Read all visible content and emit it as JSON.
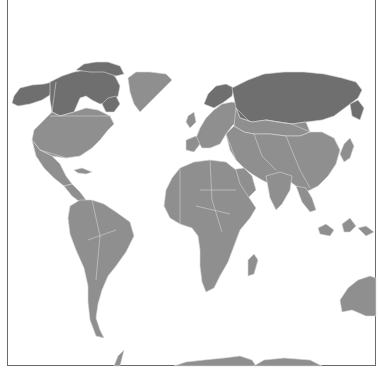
{
  "map": {
    "projection": "world",
    "colors": {
      "background": "#ffffff",
      "frame": "#6a6a6a",
      "land_base": "#8f8f8f",
      "land_dark": "#6f6f6f",
      "border": "#d4d4d4"
    },
    "regions": [
      {
        "id": "alaska",
        "shade": "dark",
        "points": "14,96 20,88 32,85 44,84 52,82 50,95 42,100 30,104 18,106 12,103"
      },
      {
        "id": "canada",
        "shade": "dark",
        "points": "50,82 62,76 74,72 86,70 98,68 110,70 116,78 120,86 118,96 112,102 100,104 92,100 86,96 80,98 74,112 60,116 52,112 50,100"
      },
      {
        "id": "canada-arctic-islands",
        "shade": "dark",
        "points": "76,70 84,64 96,62 108,62 120,66 124,74 116,76 104,72 90,72"
      },
      {
        "id": "labrador",
        "shade": "dark",
        "points": "102,104 108,98 116,96 120,104 114,112 106,112"
      },
      {
        "id": "greenland",
        "shade": "base",
        "points": "128,78 136,72 150,72 166,74 172,80 164,88 156,96 148,104 140,112 134,104 130,92"
      },
      {
        "id": "usa",
        "shade": "base",
        "points": "34,130 44,120 52,112 60,116 74,112 86,108 98,110 110,116 114,124 108,130 100,140 92,148 80,156 66,158 52,156 40,150 32,140"
      },
      {
        "id": "mexico",
        "shade": "base",
        "points": "32,140 40,150 52,156 60,164 66,176 72,184 64,186 54,178 44,168 36,156"
      },
      {
        "id": "central-america",
        "shade": "base",
        "points": "64,186 72,184 80,192 86,200 80,202 72,196"
      },
      {
        "id": "cuba",
        "shade": "base",
        "points": "74,170 82,168 92,172 86,174 78,173"
      },
      {
        "id": "south-america",
        "shade": "base",
        "points": "70,206 80,200 92,200 104,204 116,212 130,222 134,236 126,252 116,266 108,276 102,290 98,304 96,318 100,330 104,338 96,336 90,320 88,302 88,286 84,268 76,250 70,234 68,218"
      },
      {
        "id": "europe",
        "shade": "base",
        "points": "196,138 200,128 206,118 214,110 222,104 232,102 240,104 244,112 238,120 232,126 226,134 220,144 210,148 202,148"
      },
      {
        "id": "scandinavia",
        "shade": "dark",
        "points": "204,104 208,94 216,86 226,84 234,88 232,96 224,102 214,108"
      },
      {
        "id": "iberia",
        "shade": "base",
        "points": "186,140 196,136 200,144 194,152 186,150"
      },
      {
        "id": "uk",
        "shade": "base",
        "points": "188,116 194,112 196,122 190,128 186,122"
      },
      {
        "id": "russia-siberia",
        "shade": "dark",
        "points": "232,88 248,80 264,74 284,72 304,72 324,74 342,78 356,82 362,90 358,98 350,104 342,110 334,116 322,120 306,122 292,124 278,122 266,120 252,122 240,118 236,108"
      },
      {
        "id": "russia-south",
        "shade": "base",
        "points": "236,108 240,118 252,122 266,120 278,122 292,124 306,122 310,132 300,136 286,136 270,134 254,134 244,132 234,126"
      },
      {
        "id": "kamchatka",
        "shade": "dark",
        "points": "350,104 358,100 364,108 360,120 352,116"
      },
      {
        "id": "asia-main",
        "shade": "base",
        "points": "226,134 234,126 244,132 254,134 270,134 286,136 300,136 310,132 322,132 334,138 340,150 336,164 328,176 318,186 306,192 296,186 288,180 280,180 270,184 262,180 252,174 244,168 236,160 230,150"
      },
      {
        "id": "arabia",
        "shade": "base",
        "points": "230,170 244,168 252,176 256,190 248,198 238,194 232,184"
      },
      {
        "id": "india",
        "shade": "base",
        "points": "266,176 280,172 292,176 290,190 282,204 276,210 270,198"
      },
      {
        "id": "southeast-asia",
        "shade": "base",
        "points": "296,186 306,188 312,198 316,210 310,212 302,202"
      },
      {
        "id": "japan",
        "shade": "base",
        "points": "344,144 350,138 354,146 350,158 344,162 340,154"
      },
      {
        "id": "indonesia",
        "shade": "base",
        "points": "318,228 326,224 334,230 330,236 320,234"
      },
      {
        "id": "borneo",
        "shade": "base",
        "points": "342,224 350,218 356,226 350,232 344,232"
      },
      {
        "id": "new-guinea",
        "shade": "base",
        "points": "358,228 366,226 374,232 366,236"
      },
      {
        "id": "africa",
        "shade": "base",
        "points": "166,190 172,178 180,168 194,162 210,160 226,162 236,170 240,184 248,196 256,208 250,218 240,230 234,246 228,262 220,276 214,288 206,292 202,282 200,266 200,250 198,236 192,228 180,224 170,218 164,206"
      },
      {
        "id": "madagascar",
        "shade": "base",
        "points": "248,260 254,254 258,260 254,274 248,276"
      },
      {
        "id": "australia",
        "shade": "base",
        "points": "340,300 348,288 358,280 370,276 376,278 376,316 366,316 352,310 342,312"
      },
      {
        "id": "antarctica-a",
        "shade": "base",
        "points": "174,366 186,362 204,360 224,358 240,356 252,360 256,366"
      },
      {
        "id": "antarctica-b",
        "shade": "base",
        "points": "254,366 264,360 284,358 310,360 322,366"
      },
      {
        "id": "antarctic-peninsula",
        "shade": "base",
        "points": "114,366 118,356 124,350 122,358 120,366"
      }
    ],
    "borders": [
      "M 52 112 L 56 82",
      "M 50 116 L 110 116",
      "M 40 150 L 60 156 L 66 158",
      "M 236 108 L 250 122",
      "M 266 120 L 292 124 L 310 132",
      "M 180 168 L 180 224",
      "M 200 190 L 236 190",
      "M 210 160 L 212 200 L 222 232",
      "M 196 206 L 230 214",
      "M 92 200 L 100 236 L 96 280",
      "M 88 240 L 116 230",
      "M 254 134 L 262 156 L 276 170",
      "M 286 136 L 300 170 L 310 188",
      "M 226 134 L 236 160"
    ]
  }
}
